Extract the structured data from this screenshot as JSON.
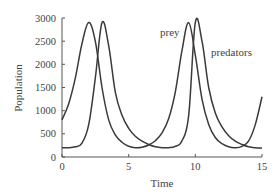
{
  "chart_data": {
    "type": "line",
    "title": "",
    "xlabel": "Time",
    "ylabel": "Population",
    "xlim": [
      0,
      15
    ],
    "ylim": [
      0,
      3000
    ],
    "xticks": [
      0,
      5,
      10,
      15
    ],
    "yticks": [
      0,
      500,
      1000,
      1500,
      2000,
      2500,
      3000
    ],
    "grid": false,
    "legend": "inline labels near curves",
    "annotations": [
      {
        "text": "prey",
        "x": 8.6,
        "y": 2700
      },
      {
        "text": "predators",
        "x": 11.2,
        "y": 2250
      }
    ],
    "x": [
      0,
      0.5,
      1,
      1.5,
      2,
      2.5,
      3,
      3.5,
      4,
      4.5,
      5,
      5.5,
      6,
      6.5,
      7,
      7.5,
      8,
      8.5,
      9,
      9.5,
      10,
      10.5,
      11,
      11.5,
      12,
      12.5,
      13,
      13.5,
      14,
      14.5,
      15
    ],
    "series": [
      {
        "name": "prey",
        "values": [
          800,
          1150,
          1700,
          2450,
          2900,
          2500,
          1500,
          800,
          480,
          320,
          230,
          200,
          210,
          260,
          350,
          520,
          830,
          1400,
          2300,
          2900,
          2200,
          1250,
          700,
          420,
          290,
          220,
          200,
          230,
          350,
          700,
          1300
        ]
      },
      {
        "name": "predators",
        "values": [
          200,
          200,
          220,
          300,
          700,
          1700,
          2900,
          2400,
          1400,
          900,
          620,
          450,
          340,
          270,
          220,
          200,
          200,
          230,
          350,
          900,
          2900,
          2500,
          1500,
          950,
          650,
          460,
          340,
          270,
          220,
          200,
          190
        ]
      }
    ]
  },
  "labels": {
    "prey": "prey",
    "predators": "predators",
    "xlabel": "Time",
    "ylabel": "Population",
    "xticks": [
      "0",
      "5",
      "10",
      "15"
    ],
    "yticks": [
      "0",
      "500",
      "1000",
      "1500",
      "2000",
      "2500",
      "3000"
    ]
  }
}
